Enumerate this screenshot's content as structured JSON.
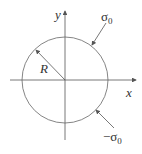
{
  "diagram": {
    "axes": {
      "x_label": "x",
      "y_label": "y"
    },
    "radius_label": "R",
    "top_load": {
      "symbol": "σ",
      "subscript": "0"
    },
    "bottom_load": {
      "symbol": "−σ",
      "subscript": "0"
    },
    "colors": {
      "stroke": "#555555",
      "text": "#333333"
    }
  }
}
